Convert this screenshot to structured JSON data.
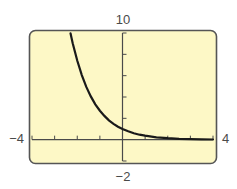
{
  "chart_data": {
    "type": "line",
    "title": "",
    "xlabel": "",
    "ylabel": "",
    "xlim": [
      -4,
      4
    ],
    "ylim": [
      -2,
      10
    ],
    "xscale_ticks": 1,
    "yscale_ticks": 2,
    "grid": false,
    "legend": null,
    "window_labels": {
      "xmin": "−4",
      "xmax": "4",
      "ymin": "−2",
      "ymax": "10"
    },
    "series": [
      {
        "name": "y = e^(-x)",
        "x": [
          -2.3,
          -2.2,
          -2.0,
          -1.8,
          -1.6,
          -1.4,
          -1.2,
          -1.0,
          -0.8,
          -0.6,
          -0.4,
          -0.2,
          0.0,
          0.25,
          0.5,
          0.75,
          1.0,
          1.5,
          2.0,
          2.5,
          3.0,
          3.5,
          4.0
        ],
        "y": [
          9.97,
          9.03,
          7.39,
          6.05,
          4.95,
          4.06,
          3.32,
          2.72,
          2.23,
          1.82,
          1.49,
          1.22,
          1.0,
          0.78,
          0.61,
          0.47,
          0.37,
          0.22,
          0.14,
          0.08,
          0.05,
          0.03,
          0.02
        ]
      }
    ],
    "colors": {
      "background": "#fdf8c6",
      "frame": "#555555",
      "axis": "#4a4a4a",
      "curve": "#1a1a1a"
    }
  }
}
